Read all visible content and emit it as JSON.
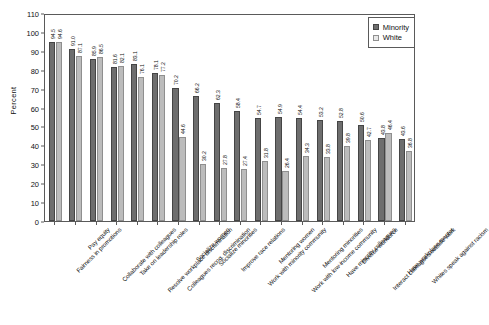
{
  "chart_data": {
    "type": "bar",
    "title": "",
    "xlabel": "",
    "ylabel": "Percent",
    "ylim": [
      0,
      110
    ],
    "ytick_step": 10,
    "yticks": [
      0,
      10,
      20,
      30,
      40,
      50,
      60,
      70,
      80,
      90,
      100,
      110
    ],
    "grid": false,
    "legend_position": "top-right",
    "value_labels": true,
    "colors": {
      "minority": "#6e6e6e",
      "white": "#bcbcbc",
      "frame": "#5a5a5a",
      "background": "#ffffff"
    },
    "categories": [
      "Fairness in promotions",
      "Pay equity",
      "Collaborate with colleagues",
      "Take on leadership roles",
      "Resolve workplace discrimination",
      "Colleagues recog. discrimination",
      "Socialize women",
      "Socialize minorities",
      "Improve race relations",
      "Work with minority community",
      "Mentoring women",
      "Work with low-income community",
      "Mentoring minorities",
      "Have minority colleagues",
      "Diverse workforce",
      "Interact colleagues outside work",
      "Have workplace mentor",
      "Whites speak against racism"
    ],
    "series": [
      {
        "name": "Minority",
        "values": [
          94.5,
          91.0,
          85.9,
          81.6,
          83.1,
          78.1,
          70.2,
          66.2,
          62.3,
          58.4,
          54.7,
          54.9,
          54.4,
          53.2,
          52.8,
          50.6,
          43.8,
          43.6
        ]
      },
      {
        "name": "White",
        "values": [
          94.6,
          87.1,
          86.5,
          82.1,
          76.1,
          77.2,
          44.6,
          30.2,
          27.8,
          27.4,
          31.8,
          26.4,
          34.3,
          33.8,
          39.8,
          42.7,
          46.4,
          36.8
        ]
      }
    ]
  },
  "legend": {
    "items": [
      {
        "label": "Minority",
        "key": "minority"
      },
      {
        "label": "White",
        "key": "white"
      }
    ]
  }
}
